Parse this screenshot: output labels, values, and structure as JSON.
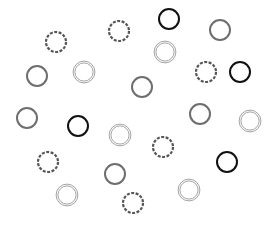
{
  "canvas": {
    "width": 273,
    "height": 226,
    "background": "#ffffff"
  },
  "styles": {
    "dashed": {
      "stroke": "#555555",
      "stroke_width": 2.2,
      "dash": "3 1.5",
      "double": false
    },
    "solid_black": {
      "stroke": "#111111",
      "stroke_width": 2.0,
      "dash": "",
      "double": false
    },
    "solid_gray": {
      "stroke": "#6e6e6e",
      "stroke_width": 2.0,
      "dash": "",
      "double": false
    },
    "double_light": {
      "stroke": "#999999",
      "stroke_width": 0.9,
      "dash": "",
      "double": true
    }
  },
  "radius": 10,
  "circles": [
    {
      "cx": 56,
      "cy": 42,
      "style": "dashed"
    },
    {
      "cx": 119,
      "cy": 31,
      "style": "dashed"
    },
    {
      "cx": 169,
      "cy": 19,
      "style": "solid_black"
    },
    {
      "cx": 220,
      "cy": 30,
      "style": "solid_gray"
    },
    {
      "cx": 165,
      "cy": 52,
      "style": "double_light"
    },
    {
      "cx": 37,
      "cy": 76,
      "style": "solid_gray"
    },
    {
      "cx": 84,
      "cy": 72,
      "style": "double_light"
    },
    {
      "cx": 142,
      "cy": 87,
      "style": "solid_gray"
    },
    {
      "cx": 206,
      "cy": 72,
      "style": "dashed"
    },
    {
      "cx": 240,
      "cy": 72,
      "style": "solid_black"
    },
    {
      "cx": 27,
      "cy": 118,
      "style": "solid_gray"
    },
    {
      "cx": 78,
      "cy": 126,
      "style": "solid_black"
    },
    {
      "cx": 120,
      "cy": 135,
      "style": "double_light"
    },
    {
      "cx": 200,
      "cy": 114,
      "style": "solid_gray"
    },
    {
      "cx": 250,
      "cy": 121,
      "style": "double_light"
    },
    {
      "cx": 163,
      "cy": 147,
      "style": "dashed"
    },
    {
      "cx": 48,
      "cy": 162,
      "style": "dashed"
    },
    {
      "cx": 115,
      "cy": 174,
      "style": "solid_gray"
    },
    {
      "cx": 227,
      "cy": 162,
      "style": "solid_black"
    },
    {
      "cx": 67,
      "cy": 195,
      "style": "double_light"
    },
    {
      "cx": 133,
      "cy": 203,
      "style": "dashed"
    },
    {
      "cx": 189,
      "cy": 190,
      "style": "double_light"
    }
  ]
}
